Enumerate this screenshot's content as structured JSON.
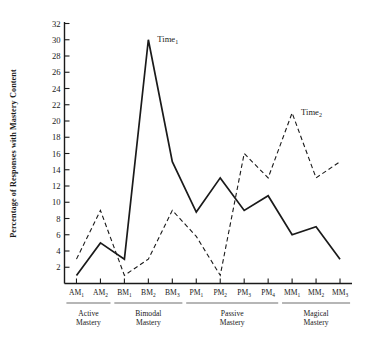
{
  "chart_data": {
    "type": "line",
    "title": "",
    "xlabel": "",
    "ylabel": "Percentage of Responses with Mastery Content",
    "ylim": [
      0,
      32
    ],
    "ytick_step": 2,
    "yticks": [
      2,
      4,
      6,
      8,
      10,
      12,
      14,
      16,
      18,
      20,
      22,
      24,
      26,
      28,
      30,
      32
    ],
    "ytick_labels": [
      "2",
      "4",
      "6",
      "8",
      "10",
      "12",
      "14",
      "16",
      "18",
      "20",
      "22",
      "24",
      "26",
      "28",
      "30",
      "32"
    ],
    "grid": false,
    "legend_position": "inline-annotation",
    "categories": [
      "AM1",
      "AM2",
      "BM1",
      "BM2",
      "BM3",
      "PM1",
      "PM2",
      "PM3",
      "PM4",
      "MM1",
      "MM2",
      "MM3"
    ],
    "category_labels": [
      {
        "base": "AM",
        "sub": "1"
      },
      {
        "base": "AM",
        "sub": "2"
      },
      {
        "base": "BM",
        "sub": "1"
      },
      {
        "base": "BM",
        "sub": "2"
      },
      {
        "base": "BM",
        "sub": "3"
      },
      {
        "base": "PM",
        "sub": "1"
      },
      {
        "base": "PM",
        "sub": "2"
      },
      {
        "base": "PM",
        "sub": "3"
      },
      {
        "base": "PM",
        "sub": "4"
      },
      {
        "base": "MM",
        "sub": "1"
      },
      {
        "base": "MM",
        "sub": "2"
      },
      {
        "base": "MM",
        "sub": "3"
      }
    ],
    "series": [
      {
        "name": "Time1",
        "label_base": "Time",
        "label_sub": "1",
        "style": "solid",
        "color": "#1a1a1a",
        "values": [
          1,
          5,
          3,
          30,
          15,
          8.8,
          13,
          9,
          10.8,
          6,
          7,
          3
        ],
        "annotation_at_index": 3
      },
      {
        "name": "Time2",
        "label_base": "Time",
        "label_sub": "2",
        "style": "dashed",
        "color": "#1a1a1a",
        "values": [
          3,
          9,
          1,
          3,
          9,
          5.8,
          1,
          16,
          13,
          21,
          13,
          15
        ],
        "annotation_at_index": 9
      }
    ],
    "groups": [
      {
        "name": "Active Mastery",
        "line1": "Active",
        "line2": "Mastery",
        "start": 0,
        "end": 1
      },
      {
        "name": "Bimodal Mastery",
        "line1": "Bimodal",
        "line2": "Mastery",
        "start": 2,
        "end": 4
      },
      {
        "name": "Passive Mastery",
        "line1": "Passive",
        "line2": "Mastery",
        "start": 5,
        "end": 8
      },
      {
        "name": "Magical Mastery",
        "line1": "Magical",
        "line2": "Mastery",
        "start": 9,
        "end": 11
      }
    ]
  }
}
